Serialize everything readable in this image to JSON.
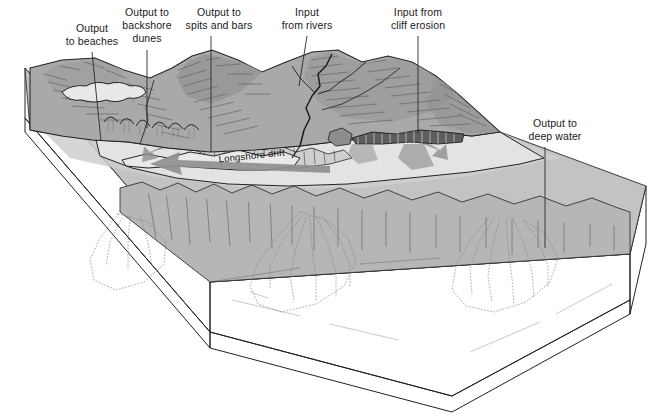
{
  "figure": {
    "type": "block-diagram",
    "background_color": "#ffffff"
  },
  "labels": [
    {
      "id": "output-to-beaches",
      "line1": "Output",
      "line2": "to beaches",
      "text": "Output to beaches",
      "text_x": 92,
      "text_y": 36,
      "leader": {
        "x1": 92,
        "y1": 52,
        "x2": 101,
        "y2": 141
      }
    },
    {
      "id": "output-to-backshore-dunes",
      "line1": "Output to",
      "line2": "backshore",
      "line3": "dunes",
      "text": "Output to backshore dunes",
      "text_x": 147,
      "text_y": 18,
      "leader": {
        "x1": 147,
        "y1": 50,
        "x2": 147,
        "y2": 128
      }
    },
    {
      "id": "output-to-spits-and-bars",
      "line1": "Output to",
      "line2": "spits and bars",
      "text": "Output to spits and bars",
      "text_x": 219,
      "text_y": 20,
      "leader": {
        "x1": 211,
        "y1": 36,
        "x2": 211,
        "y2": 152
      }
    },
    {
      "id": "input-from-rivers",
      "line1": "Input",
      "line2": "from rivers",
      "text": "Input from rivers",
      "text_x": 307,
      "text_y": 20,
      "leader": {
        "x1": 307,
        "y1": 36,
        "x2": 299,
        "y2": 86
      }
    },
    {
      "id": "input-from-cliff-erosion",
      "line1": "Input from",
      "line2": "cliff erosion",
      "text": "Input from cliff erosion",
      "text_x": 418,
      "text_y": 20,
      "leader": {
        "x1": 418,
        "y1": 36,
        "x2": 418,
        "y2": 133
      }
    },
    {
      "id": "output-to-deep-water",
      "line1": "Output to",
      "line2": "deep water",
      "text": "Output to deep water",
      "text_x": 555,
      "text_y": 131,
      "leader": {
        "x1": 545,
        "y1": 147,
        "x2": 545,
        "y2": 248
      }
    }
  ],
  "annotations": [
    {
      "id": "longshore-drift",
      "text": "Longshore drift",
      "x": 252,
      "y": 159,
      "rotation": -6
    }
  ],
  "colors": {
    "land_upper": "#a9a9a9",
    "land_shadow": "#8d8d8d",
    "beach": "#e3e3e3",
    "lagoon": "#e9e9e9",
    "seabed": "#c3c3c3",
    "sea_slope": "#b6b6b6",
    "block_left_face": "#8a8a8a",
    "block_front_upper": "#a6a6a6",
    "block_front_lower": "#8b8b8b",
    "block_right_face": "#9a9a9a",
    "outline": "#222222",
    "label_text": "#1a1a1a",
    "arrow_fill": "#8f8f8f"
  }
}
